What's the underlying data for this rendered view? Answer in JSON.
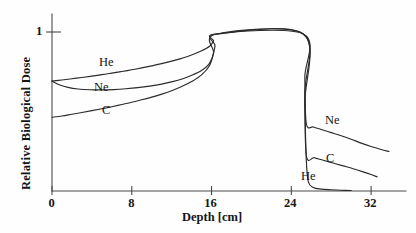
{
  "chart_data": {
    "type": "line",
    "title": "",
    "xlabel": "Depth [cm]",
    "ylabel": "Relative Biological Dose",
    "xlim": [
      0,
      35.5
    ],
    "ylim": [
      0,
      1.08
    ],
    "xticks": [
      0,
      8,
      16,
      24,
      32
    ],
    "xticklabels": [
      "0",
      "8",
      "16",
      "24",
      "32"
    ],
    "yticks": [
      1
    ],
    "yticklabels": [
      "1"
    ],
    "grid": false,
    "legend_position": "inline-annotations",
    "annotations": [
      {
        "text": "He",
        "x": 6.6,
        "y": 0.8,
        "region": "entrance-plateau"
      },
      {
        "text": "Ne",
        "x": 5.9,
        "y": 0.62,
        "region": "entrance-plateau"
      },
      {
        "text": "C",
        "x": 6.8,
        "y": 0.48,
        "region": "entrance-plateau"
      },
      {
        "text": "Ne",
        "x": 29.4,
        "y": 0.42,
        "region": "distal-tail"
      },
      {
        "text": "C",
        "x": 29.5,
        "y": 0.21,
        "region": "distal-tail"
      },
      {
        "text": "He",
        "x": 27.2,
        "y": 0.1,
        "region": "distal-tail"
      }
    ],
    "sobp_plateau": {
      "start_cm": 16.5,
      "end_cm": 25.2,
      "value": 1.0
    },
    "series": [
      {
        "name": "He",
        "entrance_dose": 0.7,
        "tail_after_peak": 0.0,
        "points": [
          [
            0.0,
            0.7
          ],
          [
            1.0,
            0.707
          ],
          [
            2.0,
            0.715
          ],
          [
            3.0,
            0.723
          ],
          [
            4.0,
            0.732
          ],
          [
            5.0,
            0.741
          ],
          [
            6.0,
            0.751
          ],
          [
            7.0,
            0.761
          ],
          [
            8.0,
            0.772
          ],
          [
            9.0,
            0.784
          ],
          [
            10.0,
            0.797
          ],
          [
            11.0,
            0.811
          ],
          [
            12.0,
            0.827
          ],
          [
            13.0,
            0.845
          ],
          [
            14.0,
            0.866
          ],
          [
            15.0,
            0.893
          ],
          [
            15.8,
            0.922
          ],
          [
            16.2,
            0.955
          ],
          [
            16.5,
            1.0
          ],
          [
            25.2,
            1.0
          ],
          [
            25.35,
            0.56
          ],
          [
            25.5,
            0.2
          ],
          [
            25.7,
            0.06
          ],
          [
            26.2,
            0.022
          ],
          [
            27.0,
            0.012
          ],
          [
            28.0,
            0.008
          ],
          [
            29.0,
            0.005
          ],
          [
            30.0,
            0.003
          ]
        ]
      },
      {
        "name": "Ne",
        "entrance_dose": 0.7,
        "tail_after_peak": 0.43,
        "points": [
          [
            0.0,
            0.7
          ],
          [
            0.8,
            0.675
          ],
          [
            1.6,
            0.66
          ],
          [
            2.6,
            0.65
          ],
          [
            3.8,
            0.645
          ],
          [
            5.0,
            0.644
          ],
          [
            6.2,
            0.646
          ],
          [
            7.4,
            0.651
          ],
          [
            8.6,
            0.658
          ],
          [
            9.8,
            0.668
          ],
          [
            11.0,
            0.681
          ],
          [
            12.2,
            0.698
          ],
          [
            13.2,
            0.717
          ],
          [
            14.2,
            0.742
          ],
          [
            15.0,
            0.768
          ],
          [
            15.7,
            0.805
          ],
          [
            16.1,
            0.855
          ],
          [
            16.35,
            0.925
          ],
          [
            16.5,
            1.0
          ],
          [
            25.2,
            1.0
          ],
          [
            25.35,
            0.72
          ],
          [
            25.5,
            0.43
          ],
          [
            26.2,
            0.408
          ],
          [
            27.0,
            0.392
          ],
          [
            28.0,
            0.372
          ],
          [
            29.0,
            0.352
          ],
          [
            30.0,
            0.33
          ],
          [
            31.0,
            0.305
          ],
          [
            32.0,
            0.283
          ],
          [
            33.0,
            0.264
          ],
          [
            33.8,
            0.252
          ]
        ]
      },
      {
        "name": "C",
        "entrance_dose": 0.47,
        "tail_after_peak": 0.225,
        "points": [
          [
            0.0,
            0.47
          ],
          [
            1.0,
            0.478
          ],
          [
            2.0,
            0.489
          ],
          [
            3.0,
            0.5
          ],
          [
            4.0,
            0.512
          ],
          [
            5.0,
            0.524
          ],
          [
            6.0,
            0.537
          ],
          [
            7.0,
            0.551
          ],
          [
            8.0,
            0.565
          ],
          [
            9.0,
            0.581
          ],
          [
            10.0,
            0.598
          ],
          [
            11.0,
            0.617
          ],
          [
            12.0,
            0.639
          ],
          [
            13.0,
            0.665
          ],
          [
            14.0,
            0.697
          ],
          [
            15.0,
            0.74
          ],
          [
            15.8,
            0.8
          ],
          [
            16.2,
            0.88
          ],
          [
            16.5,
            1.0
          ],
          [
            25.2,
            1.0
          ],
          [
            25.35,
            0.62
          ],
          [
            25.5,
            0.228
          ],
          [
            26.3,
            0.212
          ],
          [
            27.2,
            0.196
          ],
          [
            28.2,
            0.178
          ],
          [
            29.2,
            0.16
          ],
          [
            30.2,
            0.142
          ],
          [
            31.2,
            0.122
          ],
          [
            32.0,
            0.105
          ],
          [
            32.6,
            0.09
          ]
        ]
      }
    ]
  },
  "axes": {
    "x_title": "Depth [cm]",
    "y_title": "Relative Biological Dose",
    "x_tick_labels": [
      "0",
      "8",
      "16",
      "24",
      "32"
    ],
    "y_tick_labels": [
      "1"
    ]
  },
  "labels": {
    "he_entrance": "He",
    "ne_entrance": "Ne",
    "c_entrance": "C",
    "ne_tail": "Ne",
    "c_tail": "C",
    "he_tail": "He"
  },
  "style": {
    "curve_color": "#2b2b2b",
    "axis_color": "#4a4a4a",
    "text_color": "#151515",
    "background": "#fefefe"
  }
}
